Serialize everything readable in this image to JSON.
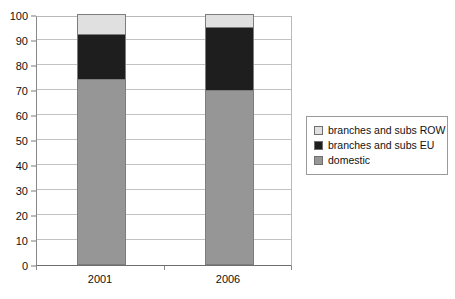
{
  "chart_data": {
    "type": "bar",
    "subtype": "stacked-column",
    "title": "",
    "xlabel": "",
    "ylabel": "",
    "categories": [
      "2001",
      "2006"
    ],
    "series": [
      {
        "name": "domestic",
        "values": [
          74,
          69.5
        ],
        "color": "#969696"
      },
      {
        "name": "branches and subs EU",
        "values": [
          18,
          25.5
        ],
        "color": "#1e1e1e"
      },
      {
        "name": "branches and subs ROW",
        "values": [
          8,
          5
        ],
        "color": "#e0e0e0"
      }
    ],
    "cumulative_tops": {
      "2001": {
        "domestic": 74,
        "branches_and_subs_EU": 92,
        "branches_and_subs_ROW": 100
      },
      "2006": {
        "domestic": 69.5,
        "branches_and_subs_EU": 95,
        "branches_and_subs_ROW": 100
      }
    },
    "ylim": [
      0,
      100
    ],
    "y_ticks": [
      "0",
      "10",
      "20",
      "30",
      "40",
      "50",
      "60",
      "70",
      "80",
      "90",
      "100"
    ],
    "y_tick_values": [
      0,
      10,
      20,
      30,
      40,
      50,
      60,
      70,
      80,
      90,
      100
    ],
    "grid": true,
    "grid_axis": "y",
    "legend_position": "right",
    "legend_entries": [
      {
        "label": "branches and subs ROW",
        "color": "#e0e0e0"
      },
      {
        "label": "branches and subs EU",
        "color": "#1e1e1e"
      },
      {
        "label": "domestic",
        "color": "#969696"
      }
    ]
  },
  "colors": {
    "row": "#e0e0e0",
    "eu": "#1e1e1e",
    "domestic": "#969696",
    "gridline": "#c2c2c2",
    "axis": "#6e6e6e",
    "bar_outline": "#7d7d7d",
    "background": "#ffffff",
    "text": "#111111"
  }
}
